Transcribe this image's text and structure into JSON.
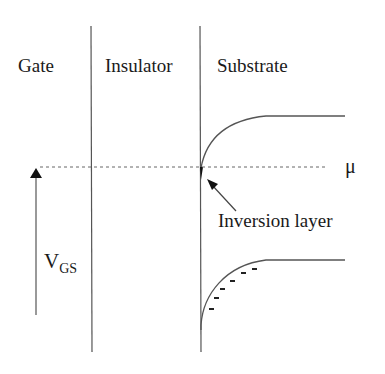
{
  "diagram": {
    "type": "MOS band diagram",
    "regions": [
      {
        "label": "Gate"
      },
      {
        "label": "Insulator"
      },
      {
        "label": "Substrate"
      }
    ],
    "fermi_level_label": "μ",
    "inversion_label": "Inversion layer",
    "voltage_label": {
      "main": "V",
      "sub": "GS"
    },
    "colors": {
      "line": "#555555",
      "text": "#1a1a1a",
      "dashed": "#666666"
    }
  }
}
